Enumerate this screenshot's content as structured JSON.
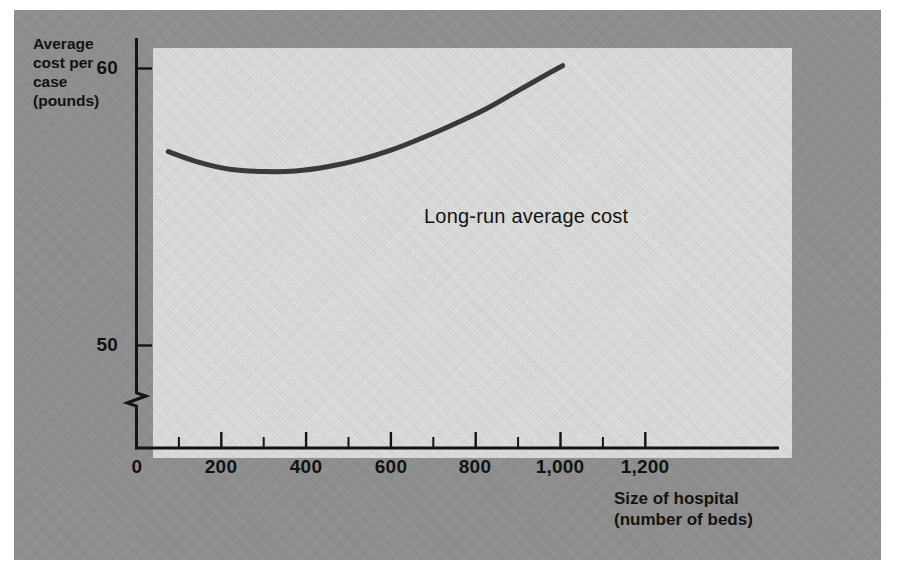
{
  "figure": {
    "panel_color": "#8e8e8e",
    "plot_background_color": "#d9d9d7",
    "axis_color": "#141414",
    "curve_color": "#3a3a3a"
  },
  "chart_data": {
    "type": "line",
    "title": "",
    "subtitle": "",
    "xlabel": "Size of hospital\n(number of beds)",
    "ylabel": "Average\ncost per\ncase\n(pounds)",
    "xlim": [
      0,
      1310
    ],
    "ylim": [
      48.6,
      60.6
    ],
    "grid": false,
    "legend_position": "inline-annotation",
    "y_axis_break": true,
    "y_axis_break_note": "zigzag break on vertical axis below 50",
    "x_tick_labels": [
      "0",
      "200",
      "400",
      "600",
      "800",
      "1,000",
      "1,200"
    ],
    "x_tick_values": [
      0,
      200,
      400,
      600,
      800,
      1000,
      1200
    ],
    "x_minor_tick_values": [
      100,
      300,
      500,
      700,
      900,
      1100
    ],
    "y_tick_labels": [
      "60",
      "50"
    ],
    "y_tick_values": [
      60,
      50
    ],
    "series": [
      {
        "name": "Long-run average cost",
        "annotation": "Long-run average cost",
        "x": [
          75,
          150,
          225,
          300,
          375,
          450,
          525,
          600,
          675,
          750,
          825,
          900,
          975,
          1005
        ],
        "y": [
          57.0,
          56.6,
          56.35,
          56.28,
          56.3,
          56.45,
          56.7,
          57.05,
          57.5,
          58.0,
          58.55,
          59.2,
          59.85,
          60.1
        ],
        "minimum_at_x": 330,
        "minimum_y": 56.28
      }
    ]
  }
}
